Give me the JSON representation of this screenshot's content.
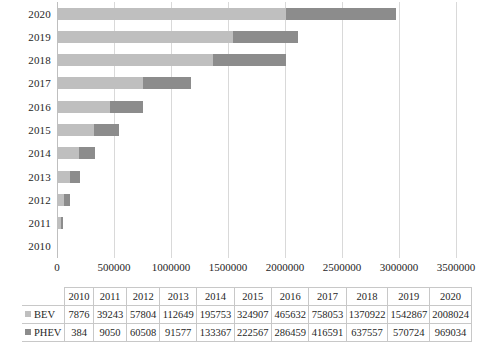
{
  "chart_data": {
    "type": "bar",
    "orientation": "horizontal",
    "stacked": true,
    "title": "",
    "xlabel": "",
    "ylabel": "",
    "categories": [
      "2010",
      "2011",
      "2012",
      "2013",
      "2014",
      "2015",
      "2016",
      "2017",
      "2018",
      "2019",
      "2020"
    ],
    "series": [
      {
        "name": "BEV",
        "color": "#bfbfbf",
        "values": [
          7876,
          39243,
          57804,
          112649,
          195753,
          324907,
          465632,
          758053,
          1370922,
          1542867,
          2008024
        ]
      },
      {
        "name": "PHEV",
        "color": "#8c8c8c",
        "values": [
          384,
          9050,
          60508,
          91577,
          133367,
          222567,
          286459,
          416591,
          637557,
          570724,
          969034
        ]
      }
    ],
    "xlim": [
      0,
      3500000
    ],
    "xticks": [
      0,
      500000,
      1000000,
      1500000,
      2000000,
      2500000,
      3000000,
      3500000
    ],
    "xtick_labels": [
      "0",
      "500000",
      "1000000",
      "1500000",
      "2000000",
      "2500000",
      "3000000",
      "3500000"
    ],
    "grid": true,
    "legend_position": "table"
  },
  "axis": {
    "y_labels": [
      "2020",
      "2019",
      "2018",
      "2017",
      "2016",
      "2015",
      "2014",
      "2013",
      "2012",
      "2011",
      "2010"
    ],
    "x_tick_labels": [
      "0",
      "500000",
      "1000000",
      "1500000",
      "2000000",
      "2500000",
      "3000000",
      "3500000"
    ]
  },
  "table": {
    "corner_label": "",
    "headers": [
      "2010",
      "2011",
      "2012",
      "2013",
      "2014",
      "2015",
      "2016",
      "2017",
      "2018",
      "2019",
      "2020"
    ],
    "rows": [
      {
        "label": "BEV",
        "color": "#bfbfbf",
        "values": [
          "7876",
          "39243",
          "57804",
          "112649",
          "195753",
          "324907",
          "465632",
          "758053",
          "1370922",
          "1542867",
          "2008024"
        ]
      },
      {
        "label": "PHEV",
        "color": "#8c8c8c",
        "values": [
          "384",
          "9050",
          "60508",
          "91577",
          "133367",
          "222567",
          "286459",
          "416591",
          "637557",
          "570724",
          "969034"
        ]
      }
    ]
  },
  "colors": {
    "bev": "#bfbfbf",
    "phev": "#8c8c8c",
    "gridline": "#d9d9d9",
    "axis": "#bfbfbf",
    "text": "#262626",
    "table_border": "#c8c8c8",
    "background": "#ffffff"
  }
}
